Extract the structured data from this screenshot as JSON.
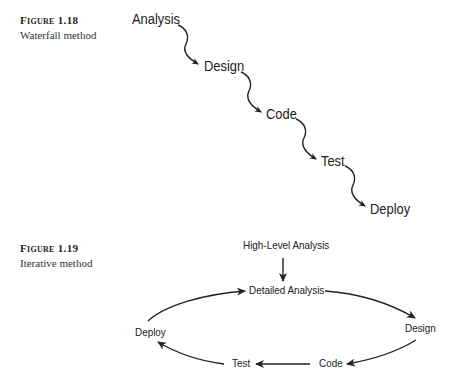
{
  "figures": [
    {
      "label": "Figure 1.18",
      "caption": "Waterfall method",
      "type": "waterfall",
      "nodes": [
        "Analysis",
        "Design",
        "Code",
        "Test",
        "Deploy"
      ]
    },
    {
      "label": "Figure 1.19",
      "caption": "Iterative method",
      "type": "iterative-cycle",
      "entry": "High-Level Analysis",
      "nodes": [
        "Detailed Analysis",
        "Design",
        "Code",
        "Test",
        "Deploy"
      ]
    }
  ]
}
